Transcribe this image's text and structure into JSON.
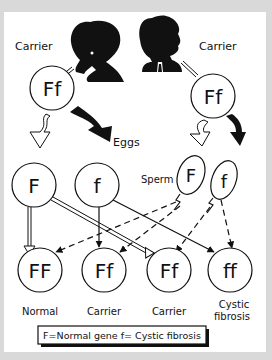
{
  "diagram": {
    "parents": [
      {
        "role": "mother",
        "label": "Carrier",
        "genotype": "Ff",
        "icon": "woman-silhouette-icon"
      },
      {
        "role": "father",
        "label": "Carrier",
        "genotype": "Ff",
        "icon": "man-silhouette-icon"
      }
    ],
    "gametes": {
      "eggs_label": "Eggs",
      "sperm_label": "Sperm",
      "eggs": [
        {
          "allele": "F"
        },
        {
          "allele": "f"
        }
      ],
      "sperm": [
        {
          "allele": "F"
        },
        {
          "allele": "f"
        }
      ]
    },
    "offspring": [
      {
        "genotype": "FF",
        "label": "Normal",
        "label2": ""
      },
      {
        "genotype": "Ff",
        "label": "Carrier",
        "label2": ""
      },
      {
        "genotype": "Ff",
        "label": "Carrier",
        "label2": ""
      },
      {
        "genotype": "ff",
        "label": "Cystic",
        "label2": "fibrosis"
      }
    ],
    "legend": "F=Normal gene  f= Cystic fibrosis",
    "colors": {
      "ink": "#111111",
      "background": "#ffffff",
      "frame": "#d9d9d9"
    }
  }
}
